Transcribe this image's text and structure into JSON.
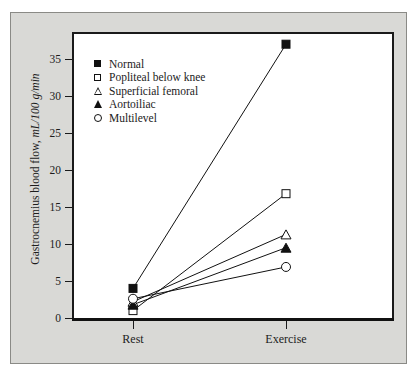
{
  "chart_data": {
    "type": "line",
    "title": "",
    "subtitle": "",
    "xlabel": "",
    "ylabel": "Gastrocnemius blood flow, mL/100 g/min",
    "ylabel_plain": "Gastrocnemius blood flow, ",
    "ylabel_unit": "mL/100 g/min",
    "categories": [
      "Rest",
      "Exercise"
    ],
    "x": [
      "Rest",
      "Exercise"
    ],
    "ylim": [
      0,
      38
    ],
    "yticks": [
      0,
      5,
      10,
      15,
      20,
      25,
      30,
      35
    ],
    "ytick_labels": [
      "0",
      "5",
      "10",
      "15",
      "20",
      "25",
      "30",
      "35"
    ],
    "xtick_labels": [
      "Rest",
      "Exercise"
    ],
    "grid": false,
    "legend_position": "upper-left inside plot",
    "series": [
      {
        "name": "Normal",
        "marker": "filled-square",
        "values": [
          4.0,
          37.0
        ]
      },
      {
        "name": "Popliteal below knee",
        "marker": "open-square",
        "values": [
          1.0,
          16.8
        ]
      },
      {
        "name": "Superficial femoral",
        "marker": "open-triangle",
        "values": [
          2.2,
          11.3
        ]
      },
      {
        "name": "Aortoiliac",
        "marker": "filled-triangle",
        "values": [
          1.8,
          9.5
        ]
      },
      {
        "name": "Multilevel",
        "marker": "open-circle",
        "values": [
          2.6,
          6.9
        ]
      }
    ]
  },
  "legend": {
    "items": [
      {
        "label": "Normal",
        "marker": "filled-square"
      },
      {
        "label": "Popliteal below knee",
        "marker": "open-square"
      },
      {
        "label": "Superficial femoral",
        "marker": "open-triangle"
      },
      {
        "label": "Aortoiliac",
        "marker": "filled-triangle"
      },
      {
        "label": "Multilevel",
        "marker": "open-circle"
      }
    ]
  },
  "axes": {
    "y_tick_0": "0",
    "y_tick_1": "5",
    "y_tick_2": "10",
    "y_tick_3": "15",
    "y_tick_4": "20",
    "y_tick_5": "25",
    "y_tick_6": "30",
    "y_tick_7": "35",
    "x_tick_0": "Rest",
    "x_tick_1": "Exercise"
  },
  "colors": {
    "panel_background": "#d9d9d6",
    "plot_background": "#ffffff",
    "axis": "#111111",
    "marker": "#111111",
    "text": "#1c1c1c"
  }
}
